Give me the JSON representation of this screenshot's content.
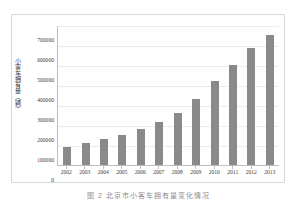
{
  "figure": {
    "caption": "图 2 北京市小客车拥有量变化情况",
    "background_color": "#ffffff",
    "frame_border_color": "#d8d8dc"
  },
  "axes": {
    "y_title": "小客车拥有量（辆）",
    "axis_line_color": "#bdbdc2",
    "gridline_color": "#ececef"
  },
  "chart_data": {
    "type": "bar",
    "title": "",
    "subtitle": "",
    "xlabel": "",
    "ylabel": "小客车拥有量（辆）",
    "categories": [
      "2002",
      "2003",
      "2004",
      "2005",
      "2006",
      "2007",
      "2008",
      "2009",
      "2010",
      "2011",
      "2012",
      "2013"
    ],
    "values": [
      92000,
      108000,
      128000,
      152000,
      182000,
      217000,
      259000,
      332000,
      418000,
      498000,
      587000,
      650000
    ],
    "ylim": [
      0,
      700000
    ],
    "y_ticks": [
      0,
      100000,
      200000,
      300000,
      400000,
      500000,
      600000,
      700000
    ],
    "y_tick_labels": [
      "0",
      "100000",
      "200000",
      "300000",
      "400000",
      "500000",
      "600000",
      "700000"
    ],
    "grid": true,
    "legend": false,
    "legend_position": "none",
    "bar_color": "#8a8a8a",
    "series": [
      {
        "name": "小客车拥有量",
        "values": [
          92000,
          108000,
          128000,
          152000,
          182000,
          217000,
          259000,
          332000,
          418000,
          498000,
          587000,
          650000
        ]
      }
    ]
  }
}
